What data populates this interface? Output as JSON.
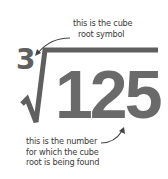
{
  "diagram": {
    "index": "3",
    "radicand": "125",
    "annotations": {
      "symbol_label": [
        "this is the cube",
        "root symbol"
      ],
      "number_label": [
        "this is the number",
        "for which the cube",
        "root is being found"
      ]
    },
    "colors": {
      "symbol": "#5f5f5f",
      "number": "#6a6a6a",
      "text": "#3a3a3a",
      "background": "#ffffff"
    }
  }
}
